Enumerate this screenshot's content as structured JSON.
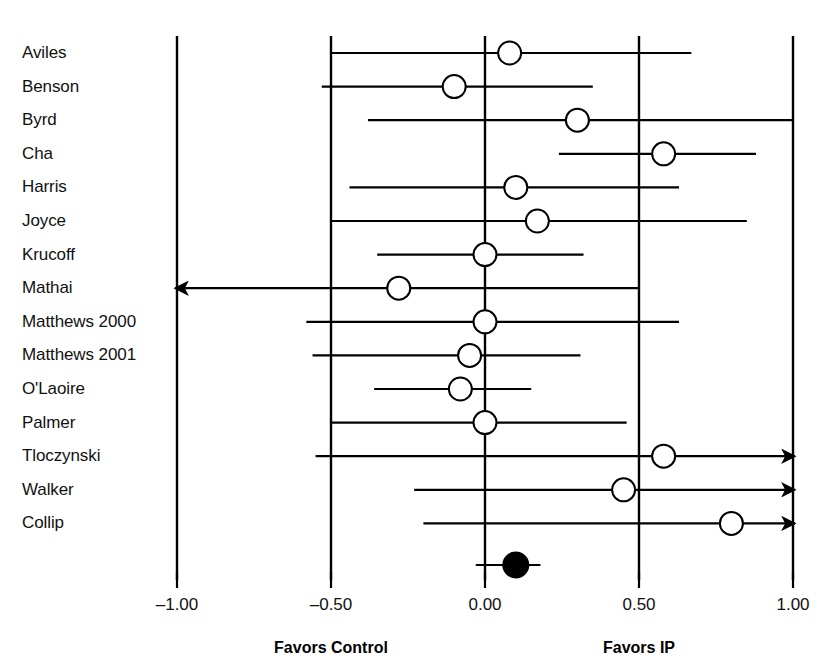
{
  "chart_data": {
    "type": "scatter",
    "plot_kind": "forest-plot",
    "title": "",
    "xlabel": "",
    "ylabel": "",
    "xlim": [
      -1.0,
      1.0
    ],
    "xticks": [
      -1.0,
      -0.5,
      0.0,
      0.5,
      1.0
    ],
    "xtick_labels": [
      "–1.00",
      "–0.50",
      "0.00",
      "0.50",
      "1.00"
    ],
    "grid": true,
    "gridlines_x": [
      -1.0,
      -0.5,
      0.0,
      0.5,
      1.0
    ],
    "legend": "none",
    "null_line": 0.0,
    "left_caption": "Favors Control",
    "right_caption": "Favors IP",
    "categories": [
      "Aviles",
      "Benson",
      "Byrd",
      "Cha",
      "Harris",
      "Joyce",
      "Krucoff",
      "Mathai",
      "Matthews 2000",
      "Matthews 2001",
      "O'Laoire",
      "Palmer",
      "Tloczynski",
      "Walker",
      "Collip"
    ],
    "studies": [
      {
        "label": "Aviles",
        "estimate": 0.08,
        "ci_low": -0.5,
        "ci_high": 0.67,
        "arrow_left": false,
        "arrow_right": false,
        "marker": "open"
      },
      {
        "label": "Benson",
        "estimate": -0.1,
        "ci_low": -0.53,
        "ci_high": 0.35,
        "arrow_left": false,
        "arrow_right": false,
        "marker": "open"
      },
      {
        "label": "Byrd",
        "estimate": 0.3,
        "ci_low": -0.38,
        "ci_high": 1.0,
        "arrow_left": false,
        "arrow_right": false,
        "marker": "open"
      },
      {
        "label": "Cha",
        "estimate": 0.58,
        "ci_low": 0.24,
        "ci_high": 0.88,
        "arrow_left": false,
        "arrow_right": false,
        "marker": "open"
      },
      {
        "label": "Harris",
        "estimate": 0.1,
        "ci_low": -0.44,
        "ci_high": 0.63,
        "arrow_left": false,
        "arrow_right": false,
        "marker": "open"
      },
      {
        "label": "Joyce",
        "estimate": 0.17,
        "ci_low": -0.5,
        "ci_high": 0.85,
        "arrow_left": false,
        "arrow_right": false,
        "marker": "open"
      },
      {
        "label": "Krucoff",
        "estimate": 0.0,
        "ci_low": -0.35,
        "ci_high": 0.32,
        "arrow_left": false,
        "arrow_right": false,
        "marker": "open"
      },
      {
        "label": "Mathai",
        "estimate": -0.28,
        "ci_low": -1.08,
        "ci_high": 0.5,
        "arrow_left": true,
        "arrow_right": false,
        "marker": "open"
      },
      {
        "label": "Matthews 2000",
        "estimate": 0.0,
        "ci_low": -0.58,
        "ci_high": 0.63,
        "arrow_left": false,
        "arrow_right": false,
        "marker": "open"
      },
      {
        "label": "Matthews 2001",
        "estimate": -0.05,
        "ci_low": -0.56,
        "ci_high": 0.31,
        "arrow_left": false,
        "arrow_right": false,
        "marker": "open"
      },
      {
        "label": "O'Laoire",
        "estimate": -0.08,
        "ci_low": -0.36,
        "ci_high": 0.15,
        "arrow_left": false,
        "arrow_right": false,
        "marker": "open"
      },
      {
        "label": "Palmer",
        "estimate": 0.0,
        "ci_low": -0.5,
        "ci_high": 0.46,
        "arrow_left": false,
        "arrow_right": false,
        "marker": "open"
      },
      {
        "label": "Tloczynski",
        "estimate": 0.58,
        "ci_low": -0.55,
        "ci_high": 1.05,
        "arrow_left": false,
        "arrow_right": true,
        "marker": "open"
      },
      {
        "label": "Walker",
        "estimate": 0.45,
        "ci_low": -0.23,
        "ci_high": 1.05,
        "arrow_left": false,
        "arrow_right": true,
        "marker": "open"
      },
      {
        "label": "Collip",
        "estimate": 0.8,
        "ci_low": -0.2,
        "ci_high": 1.05,
        "arrow_left": false,
        "arrow_right": true,
        "marker": "open"
      }
    ],
    "summary": {
      "label": "",
      "estimate": 0.1,
      "ci_low": -0.03,
      "ci_high": 0.18,
      "marker": "filled"
    }
  },
  "colors": {
    "background": "#ffffff",
    "foreground": "#000000",
    "marker_open_fill": "#ffffff",
    "marker_filled_fill": "#000000"
  }
}
